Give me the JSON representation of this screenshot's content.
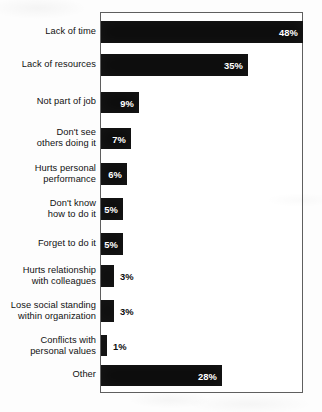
{
  "chart_data": {
    "type": "bar",
    "orientation": "horizontal",
    "title": "",
    "subtitle": "",
    "xlabel": "",
    "ylabel": "",
    "xlim": [
      0,
      48
    ],
    "grid": false,
    "legend": false,
    "value_suffix": "%",
    "bar_color": "#0d0d0d",
    "frame_color": "#5f5f5f",
    "background_color": "#ffffff",
    "categories": [
      "Lack of time",
      "Lack of resources",
      "Not part of job",
      "Don't see\nothers doing it",
      "Hurts personal\nperformance",
      "Don't know\nhow to do it",
      "Forget to do it",
      "Hurts relationship\nwith colleagues",
      "Lose social standing\nwithin organization",
      "Conflicts with\npersonal values",
      "Other"
    ],
    "values": [
      48,
      35,
      9,
      7,
      6,
      5,
      5,
      3,
      3,
      1,
      28
    ],
    "value_labels": [
      "48%",
      "35%",
      "9%",
      "7%",
      "6%",
      "5%",
      "5%",
      "3%",
      "3%",
      "1%",
      "28%"
    ],
    "label_placement": [
      "inside",
      "inside",
      "inside",
      "inside",
      "inside",
      "inside",
      "inside",
      "outside",
      "outside",
      "outside",
      "inside"
    ]
  },
  "bars": [
    {
      "label": "Lack of time",
      "value": 48,
      "value_label": "48%",
      "placement": "inside",
      "top": 21,
      "height": 22,
      "label_top": 26,
      "width": 202
    },
    {
      "label": "Lack of resources",
      "value": 35,
      "value_label": "35%",
      "placement": "inside",
      "top": 54,
      "height": 22,
      "label_top": 59,
      "width": 147
    },
    {
      "label": "Not part of job",
      "value": 9,
      "value_label": "9%",
      "placement": "inside",
      "top": 92,
      "height": 21,
      "label_top": 96,
      "width": 38
    },
    {
      "label": "Don't see\nothers doing it",
      "value": 7,
      "value_label": "7%",
      "placement": "inside",
      "top": 128,
      "height": 21,
      "label_top": 127,
      "width": 30
    },
    {
      "label": "Hurts personal\nperformance",
      "value": 6,
      "value_label": "6%",
      "placement": "inside",
      "top": 163,
      "height": 22,
      "label_top": 163,
      "width": 26
    },
    {
      "label": "Don't know\nhow to do it",
      "value": 5,
      "value_label": "5%",
      "placement": "inside",
      "top": 198,
      "height": 22,
      "label_top": 198,
      "width": 22
    },
    {
      "label": "Forget to do it",
      "value": 5,
      "value_label": "5%",
      "placement": "inside",
      "top": 233,
      "height": 22,
      "label_top": 238,
      "width": 22
    },
    {
      "label": "Hurts relationship\nwith colleagues",
      "value": 3,
      "value_label": "3%",
      "placement": "outside",
      "top": 265,
      "height": 22,
      "label_top": 265,
      "width": 13
    },
    {
      "label": "Lose social standing\nwithin organization",
      "value": 3,
      "value_label": "3%",
      "placement": "outside",
      "top": 300,
      "height": 22,
      "label_top": 300,
      "width": 13
    },
    {
      "label": "Conflicts with\npersonal values",
      "value": 1,
      "value_label": "1%",
      "placement": "outside",
      "top": 335,
      "height": 21,
      "label_top": 335,
      "width": 6
    },
    {
      "label": "Other",
      "value": 28,
      "value_label": "28%",
      "placement": "inside",
      "top": 365,
      "height": 21,
      "label_top": 369,
      "width": 121
    }
  ]
}
